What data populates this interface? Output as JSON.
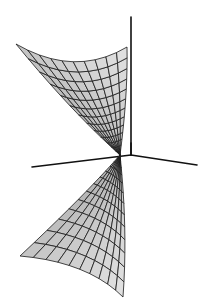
{
  "figure": {
    "title": "Wireframe surface with coordinate axes",
    "colors": {
      "background": "#ffffff",
      "mesh_line": "#1a1a1a",
      "surface_fill": "#d6d6d6",
      "axis": "#111111"
    },
    "axes": {
      "origin": [
        131,
        155
      ],
      "vertical_top": [
        131,
        17
      ],
      "left_end": [
        32,
        167
      ],
      "right_end": [
        197,
        165
      ]
    },
    "pinch_point": [
      120,
      155
    ],
    "upper_sheet": {
      "left_tip": [
        16,
        44
      ],
      "right_tip": [
        127,
        47
      ],
      "grid_u": 14,
      "grid_v": 10
    },
    "lower_sheet": {
      "left_tip": [
        20,
        256
      ],
      "bottom_tip": [
        123,
        297
      ],
      "grid_u": 14,
      "grid_v": 10
    }
  }
}
